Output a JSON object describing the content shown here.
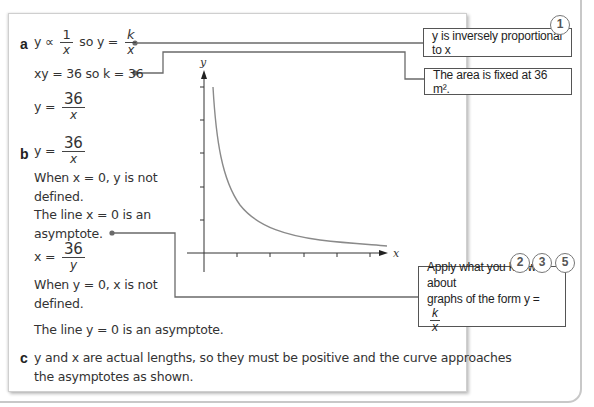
{
  "part_a": {
    "label": "a",
    "line1": {
      "prefix": "y ∝",
      "frac1_num": "1",
      "frac1_den": "x",
      "mid": "so y =",
      "frac2_num": "k",
      "frac2_den": "x"
    },
    "line2": "xy = 36 so k = 36",
    "line3": {
      "prefix": "y =",
      "num": "36",
      "den": "x"
    }
  },
  "part_b": {
    "label": "b",
    "line1": {
      "prefix": "y =",
      "num": "36",
      "den": "x"
    },
    "line2": "When x = 0, y is not",
    "line3": "defined.",
    "line4": "The line x = 0 is an",
    "line5": "asymptote.",
    "line6": {
      "prefix": "x =",
      "num": "36",
      "den": "y"
    },
    "line7": "When y = 0, x is not",
    "line8": "defined.",
    "line9": "The line y = 0 is an asymptote."
  },
  "part_c": {
    "label": "c",
    "line1": "y and x are actual lengths, so they must be positive and the curve approaches",
    "line2": "the asymptotes as shown."
  },
  "callouts": [
    {
      "text": "y is inversely proportional to x",
      "badges": [
        "1"
      ]
    },
    {
      "text": "The area is fixed at 36 m².",
      "badges": []
    },
    {
      "text_line1": "Apply what you know about",
      "text_line2_prefix": "graphs of the form y =",
      "frac_num": "k",
      "frac_den": "x",
      "badges": [
        "2",
        "3",
        "5"
      ]
    }
  ],
  "graph": {
    "x_label": "x",
    "y_label": "y",
    "curve": "y = 36/x",
    "x_ticks": 5,
    "y_ticks": 5
  },
  "colors": {
    "curve": "#8a8a8a",
    "axis": "#333333",
    "connector": "#6a6a6a",
    "border": "#c8c8c8"
  }
}
